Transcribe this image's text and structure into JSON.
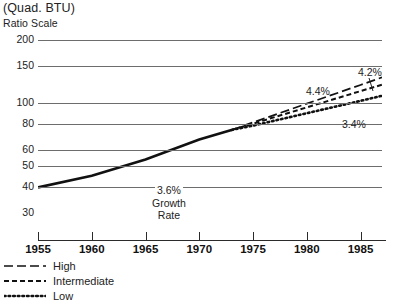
{
  "header": {
    "unit_title": "(Quad. BTU)",
    "scale_note": "Ratio Scale"
  },
  "legend": {
    "items": [
      {
        "label": "High",
        "style": "long-dash"
      },
      {
        "label": "Intermediate",
        "style": "short-dash"
      },
      {
        "label": "Low",
        "style": "dotted"
      }
    ]
  },
  "annotations": {
    "historical_rate": "3.6%",
    "growth_word": "Growth",
    "rate_word": "Rate",
    "high_rate": "4.2%",
    "intermediate_rate": "4.4%",
    "low_rate": "3.4%"
  },
  "colors": {
    "line": "#111111",
    "grid": "#6d6d6d",
    "text": "#222222"
  },
  "chart_data": {
    "type": "line",
    "title": "(Quad. BTU)",
    "subtitle": "Ratio Scale",
    "xlabel": "",
    "ylabel": "(Quad. BTU)",
    "scale": "log",
    "grid": true,
    "legend_position": "below-left",
    "xlim": [
      1955,
      1987
    ],
    "ylim": [
      30,
      200
    ],
    "ytick_labels": [
      "200",
      "150",
      "100",
      "80",
      "60",
      "50",
      "40",
      "30"
    ],
    "ytick_values": [
      200,
      150,
      100,
      80,
      60,
      50,
      40,
      30
    ],
    "xtick_labels": [
      "1955",
      "1960",
      "1965",
      "1970",
      "1975",
      "1980",
      "1985"
    ],
    "xtick_values": [
      1955,
      1960,
      1965,
      1970,
      1975,
      1980,
      1985
    ],
    "series": [
      {
        "name": "Historical",
        "style": "solid",
        "growth_rate": "3.6%",
        "x": [
          1955,
          1960,
          1965,
          1970,
          1973
        ],
        "values": [
          39.7,
          45.1,
          54.0,
          67.1,
          74.6
        ]
      },
      {
        "name": "High",
        "style": "long-dash",
        "growth_rate": "4.2%",
        "x": [
          1973,
          1975,
          1980,
          1985,
          1987
        ],
        "values": [
          74.6,
          81.0,
          99.5,
          122.2,
          132.7
        ]
      },
      {
        "name": "Intermediate",
        "style": "short-dash",
        "growth_rate": "4.4%",
        "x": [
          1973,
          1975,
          1980,
          1985,
          1987
        ],
        "values": [
          74.6,
          79.9,
          95.5,
          114.2,
          122.5
        ]
      },
      {
        "name": "Low",
        "style": "dotted",
        "growth_rate": "3.4%",
        "x": [
          1973,
          1975,
          1980,
          1985,
          1987
        ],
        "values": [
          74.6,
          78.2,
          89.6,
          102.6,
          108.5
        ]
      }
    ]
  }
}
